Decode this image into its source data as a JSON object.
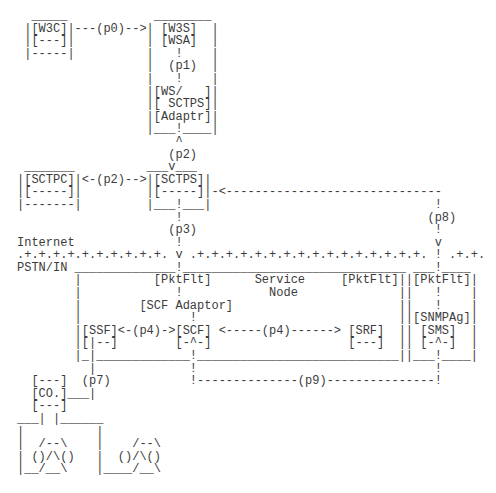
{
  "diagram": {
    "lines": [
      "  _____            ________",
      " |[W3C]|---(p0)-->| [W3S]  |",
      " |[---]|          | [WSA]  |",
      " |-----|          |   !    |",
      "                  |  (p1)  |",
      "                  |   !    |",
      "                  |[WS/   ]|",
      "                  |[ SCTPS]|",
      "                  |[Adaptr]|",
      "                  |___!____|",
      "                      ^",
      "                     (p2)",
      " _______          ___v___",
      "|[SCTPC]|<-(p2)-->|[SCTPS]|",
      "|[-----]|         |[-----]|-<------------------------------",
      "|-------|         |___!___|                               !",
      "                      !                                  (p8)",
      "                     (p3)                                 !",
      "Internet              !                                   v",
      ".+.+.+.+.+.+.+.+.+.+. v .+.+.+.+.+.+.+.+.+.+.+.+.+.+.+.+. ! .+.+.",
      "PSTN/IN ______________!_______________________________ ___!____",
      "        |          [PktFlt]      Service     [PktFlt]||[PktFlt]|",
      "        |             !            Node              ||   !    |",
      "        |        [SCF Adaptor]                       ||   !    |",
      "        |               !                            ||[SNMPAg]|",
      "        |[SSF]<-(p4)->[SCF] <-----(p4)------> [SRF]  || [SMS]  |",
      "        |[|--]        [-^-]                   [---]  || [-^-]  |",
      "        |_|_____________!____________________________||___!____|",
      "          |             !                                 !",
      "  [---]  (p7)           !--------------(p9)---------------!",
      "  [CO.]___|",
      "  [---]",
      "___| |______",
      "|          |",
      "|  /--\\    |    /--\\",
      "| ()/\\()   |  ()/\\()",
      "|__/__\\    |____/__\\"
    ]
  },
  "nodes": {
    "w3c_client": [
      "[W3C]",
      "[---]"
    ],
    "web_server": [
      "[W3S]",
      "[WSA]",
      "[WS/   ]",
      "[ SCTPS]",
      "[Adaptr]"
    ],
    "sctp_client": [
      "[SCTPC]",
      "[-----]"
    ],
    "sctp_server": [
      "[SCTPS]",
      "[-----]"
    ],
    "service_node": {
      "title": "Service Node",
      "packet_filters": [
        "[PktFlt]",
        "[PktFlt]"
      ],
      "adaptor": "[SCF Adaptor]",
      "functions": [
        "[SSF]",
        "[SCF]",
        "[SRF]"
      ]
    },
    "management": [
      "[PktFlt]",
      "[SNMPAg]",
      "[SMS]"
    ],
    "central_office": "[CO.]"
  },
  "links": [
    "(p0)",
    "(p1)",
    "(p2)",
    "(p2)",
    "(p3)",
    "(p4)",
    "(p4)",
    "(p7)",
    "(p8)",
    "(p9)"
  ],
  "regions": {
    "upper": "Internet",
    "lower": "PSTN/IN"
  }
}
